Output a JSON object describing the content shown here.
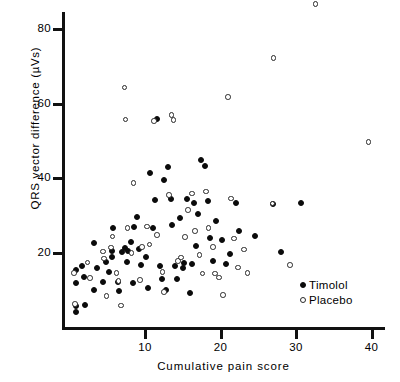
{
  "chart_data": {
    "type": "scatter",
    "title": "",
    "xlabel": "Cumulative pain score",
    "ylabel": "QRS vector difference (µVs)",
    "xlim": [
      0,
      42
    ],
    "ylim": [
      0,
      92
    ],
    "xticks": [
      10,
      20,
      30,
      40
    ],
    "yticks": [
      20,
      40,
      60,
      80
    ],
    "grid": false,
    "legend_position": "bottom-right",
    "series": [
      {
        "name": "Timolol",
        "marker": "filled-circle",
        "color": "#0b0b0b",
        "points": [
          [
            0.8,
            15.5
          ],
          [
            0.8,
            12.0
          ],
          [
            0.8,
            5.9
          ],
          [
            0.8,
            4.3
          ],
          [
            1.6,
            16.5
          ],
          [
            1.9,
            13.6
          ],
          [
            2.0,
            6.2
          ],
          [
            3.2,
            22.7
          ],
          [
            3.3,
            10.2
          ],
          [
            3.6,
            16.0
          ],
          [
            4.5,
            12.3
          ],
          [
            4.8,
            17.6
          ],
          [
            5.2,
            15.0
          ],
          [
            5.6,
            20.6
          ],
          [
            5.6,
            19.0
          ],
          [
            5.7,
            26.7
          ],
          [
            6.4,
            12.4
          ],
          [
            6.6,
            9.9
          ],
          [
            6.9,
            20.4
          ],
          [
            7.3,
            21.3
          ],
          [
            7.6,
            17.6
          ],
          [
            7.8,
            20.6
          ],
          [
            8.2,
            23.0
          ],
          [
            8.4,
            11.9
          ],
          [
            8.6,
            27.0
          ],
          [
            9.0,
            29.8
          ],
          [
            9.2,
            21.2
          ],
          [
            9.5,
            16.8
          ],
          [
            10.1,
            19.0
          ],
          [
            10.4,
            10.6
          ],
          [
            10.6,
            41.4
          ],
          [
            11.0,
            26.8
          ],
          [
            11.3,
            34.3
          ],
          [
            11.6,
            55.9
          ],
          [
            12.0,
            16.7
          ],
          [
            12.2,
            13.0
          ],
          [
            12.5,
            39.7
          ],
          [
            12.8,
            10.2
          ],
          [
            13.1,
            43.0
          ],
          [
            13.4,
            34.5
          ],
          [
            13.6,
            27.6
          ],
          [
            14.0,
            16.5
          ],
          [
            14.3,
            13.2
          ],
          [
            14.6,
            29.4
          ],
          [
            15.0,
            16.0
          ],
          [
            15.2,
            17.3
          ],
          [
            15.5,
            34.6
          ],
          [
            15.9,
            9.4
          ],
          [
            16.2,
            17.0
          ],
          [
            16.5,
            33.5
          ],
          [
            16.8,
            22.0
          ],
          [
            17.0,
            30.6
          ],
          [
            17.4,
            44.9
          ],
          [
            17.9,
            43.3
          ],
          [
            18.3,
            33.9
          ],
          [
            18.6,
            24.0
          ],
          [
            19.0,
            17.8
          ],
          [
            19.4,
            28.7
          ],
          [
            20.2,
            23.6
          ],
          [
            20.7,
            17.2
          ],
          [
            21.3,
            19.8
          ],
          [
            22.1,
            33.3
          ],
          [
            22.4,
            26.0
          ],
          [
            24.6,
            24.6
          ],
          [
            26.9,
            33.2
          ],
          [
            28.0,
            20.4
          ],
          [
            30.6,
            33.3
          ]
        ]
      },
      {
        "name": "Placebo",
        "marker": "open-circle",
        "color": "#2a2a2a",
        "points": [
          [
            0.6,
            14.7
          ],
          [
            0.7,
            6.4
          ],
          [
            2.4,
            17.5
          ],
          [
            2.7,
            13.4
          ],
          [
            4.4,
            20.5
          ],
          [
            4.6,
            18.6
          ],
          [
            4.9,
            8.6
          ],
          [
            5.5,
            21.5
          ],
          [
            5.7,
            24.5
          ],
          [
            6.2,
            14.7
          ],
          [
            6.5,
            12.5
          ],
          [
            6.8,
            6.0
          ],
          [
            7.3,
            64.3
          ],
          [
            7.4,
            55.8
          ],
          [
            7.7,
            26.8
          ],
          [
            8.2,
            20.1
          ],
          [
            8.5,
            38.8
          ],
          [
            9.3,
            12.9
          ],
          [
            9.6,
            21.6
          ],
          [
            10.3,
            27.1
          ],
          [
            10.6,
            22.3
          ],
          [
            11.2,
            55.4
          ],
          [
            11.6,
            24.8
          ],
          [
            12.3,
            14.9
          ],
          [
            12.5,
            9.7
          ],
          [
            13.2,
            35.5
          ],
          [
            13.5,
            56.9
          ],
          [
            13.8,
            55.6
          ],
          [
            14.4,
            17.9
          ],
          [
            14.8,
            18.8
          ],
          [
            15.3,
            24.3
          ],
          [
            15.7,
            31.6
          ],
          [
            16.2,
            36.0
          ],
          [
            16.6,
            25.9
          ],
          [
            17.2,
            19.5
          ],
          [
            17.6,
            14.6
          ],
          [
            18.1,
            36.5
          ],
          [
            18.4,
            26.7
          ],
          [
            19.0,
            21.7
          ],
          [
            19.3,
            14.6
          ],
          [
            19.8,
            13.5
          ],
          [
            20.3,
            8.8
          ],
          [
            21.0,
            61.7
          ],
          [
            21.4,
            34.6
          ],
          [
            21.8,
            23.9
          ],
          [
            22.3,
            16.2
          ],
          [
            23.1,
            21.0
          ],
          [
            23.6,
            14.7
          ],
          [
            26.9,
            33.3
          ],
          [
            27.0,
            72.2
          ],
          [
            29.2,
            16.9
          ],
          [
            32.6,
            86.6
          ],
          [
            39.6,
            49.8
          ]
        ]
      }
    ]
  },
  "legend": {
    "items": [
      {
        "label": "Timolol",
        "marker": "filled-circle"
      },
      {
        "label": "Placebo",
        "marker": "open-circle"
      }
    ]
  },
  "axes": {
    "x_title": "Cumulative pain score",
    "y_title": "QRS vector difference (µVs)",
    "x_tick_labels": [
      "10",
      "20",
      "30",
      "40"
    ],
    "y_tick_labels": [
      "20",
      "40",
      "60",
      "80"
    ]
  }
}
